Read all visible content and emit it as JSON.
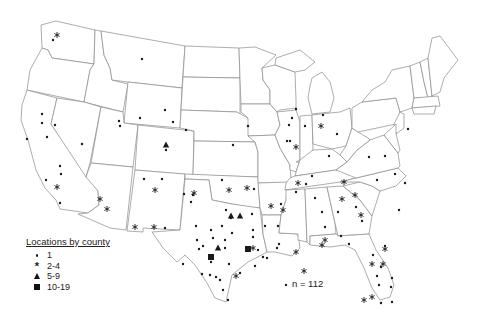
{
  "legend": {
    "title": "Locations by county",
    "items": [
      {
        "symbol": "dot",
        "label": "1"
      },
      {
        "symbol": "asterisk",
        "label": "2-4"
      },
      {
        "symbol": "triangle",
        "label": "5-9"
      },
      {
        "symbol": "square",
        "label": "10-19"
      }
    ]
  },
  "annotation": {
    "n_label": "n = 112"
  },
  "colors": {
    "marker": "#1a1a1a",
    "state_border": "#8a8a8a",
    "background": "#ffffff"
  },
  "markers": {
    "dot": [
      [
        53,
        40
      ],
      [
        42,
        114
      ],
      [
        42,
        123
      ],
      [
        47,
        137
      ],
      [
        27,
        139
      ],
      [
        55,
        125
      ],
      [
        82,
        144
      ],
      [
        60,
        166
      ],
      [
        61,
        174
      ],
      [
        46,
        180
      ],
      [
        60,
        203
      ],
      [
        166,
        150
      ],
      [
        162,
        179
      ],
      [
        173,
        122
      ],
      [
        140,
        118
      ],
      [
        119,
        121
      ],
      [
        120,
        126
      ],
      [
        142,
        59
      ],
      [
        165,
        110
      ],
      [
        186,
        130
      ],
      [
        222,
        180
      ],
      [
        233,
        145
      ],
      [
        248,
        126
      ],
      [
        289,
        125
      ],
      [
        292,
        118
      ],
      [
        287,
        141
      ],
      [
        254,
        189
      ],
      [
        290,
        141
      ],
      [
        281,
        204
      ],
      [
        296,
        109
      ],
      [
        305,
        126
      ],
      [
        323,
        115
      ],
      [
        337,
        134
      ],
      [
        329,
        156
      ],
      [
        385,
        156
      ],
      [
        395,
        174
      ],
      [
        377,
        180
      ],
      [
        408,
        129
      ],
      [
        296,
        192
      ],
      [
        144,
        179
      ],
      [
        191,
        202
      ],
      [
        165,
        228
      ],
      [
        183,
        264
      ],
      [
        184,
        194
      ],
      [
        193,
        195
      ],
      [
        196,
        226
      ],
      [
        222,
        226
      ],
      [
        211,
        230
      ],
      [
        203,
        246
      ],
      [
        225,
        240
      ],
      [
        226,
        210
      ],
      [
        231,
        218
      ],
      [
        232,
        233
      ],
      [
        229,
        264
      ],
      [
        213,
        238
      ],
      [
        197,
        240
      ],
      [
        211,
        262
      ],
      [
        199,
        249
      ],
      [
        202,
        274
      ],
      [
        210,
        275
      ],
      [
        216,
        277
      ],
      [
        220,
        280
      ],
      [
        225,
        248
      ],
      [
        240,
        273
      ],
      [
        223,
        290
      ],
      [
        228,
        300
      ],
      [
        252,
        214
      ],
      [
        253,
        230
      ],
      [
        253,
        237
      ],
      [
        258,
        250
      ],
      [
        255,
        266
      ],
      [
        263,
        257
      ],
      [
        267,
        258
      ],
      [
        277,
        248
      ],
      [
        279,
        244
      ],
      [
        265,
        226
      ],
      [
        278,
        226
      ],
      [
        312,
        176
      ],
      [
        315,
        198
      ],
      [
        322,
        212
      ],
      [
        325,
        227
      ],
      [
        286,
        285
      ],
      [
        306,
        184
      ],
      [
        338,
        212
      ],
      [
        341,
        236
      ],
      [
        349,
        244
      ],
      [
        356,
        207
      ],
      [
        369,
        157
      ],
      [
        399,
        210
      ],
      [
        405,
        183
      ],
      [
        362,
        221
      ],
      [
        373,
        255
      ],
      [
        385,
        246
      ],
      [
        381,
        267
      ],
      [
        377,
        276
      ],
      [
        379,
        285
      ],
      [
        392,
        278
      ],
      [
        391,
        287
      ],
      [
        381,
        303
      ],
      [
        392,
        302
      ]
    ],
    "asterisk": [
      [
        57,
        35
      ],
      [
        57,
        187
      ],
      [
        100,
        199
      ],
      [
        107,
        209
      ],
      [
        155,
        190
      ],
      [
        135,
        227
      ],
      [
        154,
        227
      ],
      [
        194,
        193
      ],
      [
        229,
        190
      ],
      [
        247,
        188
      ],
      [
        271,
        206
      ],
      [
        298,
        183
      ],
      [
        344,
        182
      ],
      [
        342,
        199
      ],
      [
        355,
        195
      ],
      [
        361,
        215
      ],
      [
        253,
        248
      ],
      [
        296,
        252
      ],
      [
        385,
        249
      ],
      [
        383,
        264
      ],
      [
        372,
        264
      ],
      [
        372,
        297
      ],
      [
        364,
        300
      ],
      [
        304,
        271
      ],
      [
        325,
        240
      ],
      [
        322,
        245
      ],
      [
        236,
        276
      ],
      [
        321,
        126
      ],
      [
        283,
        210
      ],
      [
        296,
        147
      ]
    ],
    "triangle": [
      [
        166,
        145
      ],
      [
        231,
        216
      ],
      [
        240,
        216
      ],
      [
        218,
        248
      ]
    ],
    "square": [
      [
        211,
        257
      ],
      [
        248,
        249
      ]
    ]
  }
}
